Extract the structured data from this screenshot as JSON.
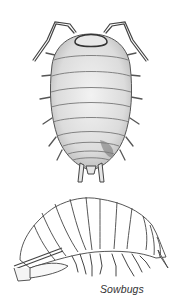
{
  "figure": {
    "caption": "Sowbugs",
    "illustrations": [
      {
        "view": "dorsal",
        "subject": "sowbug"
      },
      {
        "view": "lateral",
        "subject": "sowbug"
      }
    ]
  },
  "colors": {
    "ink": "#3a3a3a",
    "shade": "#d9d9d9",
    "background": "#ffffff"
  }
}
